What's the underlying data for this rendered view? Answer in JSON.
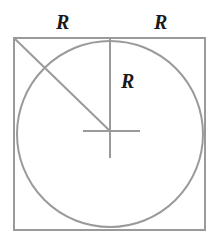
{
  "figure": {
    "background_color": "#ffffff",
    "stroke_color": "#9a9a9a",
    "label_color": "#1a1a1a",
    "labels": {
      "top_left": "R",
      "top_right": "R",
      "radius": "R"
    },
    "geometry": {
      "square": {
        "x": 14,
        "y": 38,
        "width": 191,
        "height": 192
      },
      "circle": {
        "cx": 110,
        "cy": 134,
        "r": 93
      },
      "diagonal": {
        "x1": 14,
        "y1": 38,
        "x2": 110,
        "y2": 131
      },
      "vertical_radius": {
        "x1": 110,
        "y1": 38,
        "x2": 110,
        "y2": 131
      },
      "center_cross": {
        "horizontal": {
          "x1": 83,
          "y1": 131,
          "x2": 140,
          "y2": 131
        },
        "vertical": {
          "x1": 110,
          "y1": 131,
          "x2": 110,
          "y2": 158
        }
      }
    }
  }
}
